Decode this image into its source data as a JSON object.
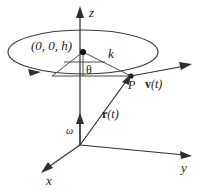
{
  "figure": {
    "background_color": "#ffffff",
    "line_color": "#3a3a3a",
    "label_color": "#1a1a1a"
  },
  "axes": {
    "z": {
      "label": "z",
      "origin": [
        80,
        145
      ],
      "tip": [
        80,
        8
      ]
    },
    "y": {
      "label": "y",
      "origin": [
        80,
        145
      ],
      "tip": [
        191,
        156
      ]
    },
    "x": {
      "label": "x",
      "origin": [
        80,
        145
      ],
      "tip": [
        41,
        173
      ]
    }
  },
  "circle": {
    "center_label": "(0, 0, h)",
    "center_point": [
      83,
      52
    ],
    "radius_x": 75,
    "radius_y": 22,
    "direction_arrow": "counterclockwise"
  },
  "points": {
    "P": {
      "label": "P",
      "position": [
        131,
        76
      ]
    },
    "center_dot": {
      "position": [
        83,
        52
      ]
    }
  },
  "vectors": {
    "radius_k": {
      "label": "k"
    },
    "position": {
      "label": "r(t)",
      "bold_part": "r",
      "paren_part": "(t)"
    },
    "velocity": {
      "label": "v(t)",
      "bold_part": "v",
      "paren_part": "(t)"
    },
    "angular": {
      "label": "ω"
    }
  },
  "angle": {
    "label": "θ",
    "vertex": [
      83,
      52
    ]
  }
}
